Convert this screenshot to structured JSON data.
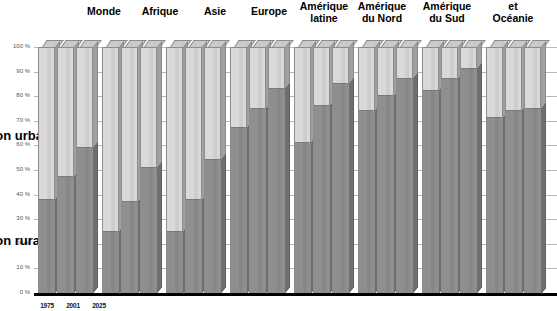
{
  "chart_data": {
    "type": "bar",
    "subtype": "stacked-100-percent-3d",
    "title": "",
    "xlabel": "",
    "ylabel": "",
    "ylim": [
      0,
      100
    ],
    "grid": true,
    "legend_position": "left-outside-clipped",
    "categories": [
      "1975",
      "2001",
      "2025"
    ],
    "groups": [
      "Monde",
      "Afrique",
      "Asie",
      "Europe",
      "Amérique latine",
      "Amérique du Nord",
      "Amérique du Sud",
      "et Océanie"
    ],
    "ytick_labels": [
      "100 %",
      "90 %",
      "80 %",
      "70 %",
      "60 %",
      "50 %",
      "40 %",
      "30 %",
      "20 %",
      "10 %",
      "0 %"
    ],
    "ytick_values": [
      100,
      90,
      80,
      70,
      60,
      50,
      40,
      30,
      20,
      10,
      0
    ],
    "series": [
      {
        "name": "Population urbaine",
        "color": "#8f8f8f",
        "values_by_group": {
          "Monde": [
            38,
            47,
            59
          ],
          "Afrique": [
            25,
            37,
            51
          ],
          "Asie": [
            25,
            38,
            54
          ],
          "Europe": [
            67,
            75,
            83
          ],
          "Amérique latine": [
            61,
            76,
            85
          ],
          "Amérique du Nord": [
            74,
            80,
            87
          ],
          "Amérique du Sud": [
            82,
            87,
            91
          ],
          "et Océanie": [
            71,
            74,
            75
          ]
        }
      },
      {
        "name": "Population rurale",
        "color": "#d9d9d9",
        "values_by_group": {
          "Monde": [
            62,
            53,
            41
          ],
          "Afrique": [
            75,
            63,
            49
          ],
          "Asie": [
            75,
            62,
            46
          ],
          "Europe": [
            33,
            25,
            17
          ],
          "Amérique latine": [
            39,
            24,
            15
          ],
          "Amérique du Nord": [
            26,
            20,
            13
          ],
          "Amérique du Sud": [
            18,
            13,
            9
          ],
          "et Océanie": [
            29,
            26,
            25
          ]
        }
      }
    ]
  },
  "legend_stubs": [
    {
      "text": "Population urbaine",
      "visible_fragment": "le",
      "top": 128
    },
    {
      "text": "Population rurale",
      "visible_fragment": "ine",
      "top": 233
    }
  ],
  "group_titles": [
    {
      "label": "Monde",
      "cx": 104,
      "top": 6
    },
    {
      "label": "Afrique",
      "cx": 160,
      "top": 6
    },
    {
      "label": "Asie",
      "cx": 215,
      "top": 6
    },
    {
      "label": "Europe",
      "cx": 269,
      "top": 6
    },
    {
      "label": "Amérique\nlatine",
      "cx": 324,
      "top": 1
    },
    {
      "label": "Amérique\ndu Nord",
      "cx": 382,
      "top": 1
    },
    {
      "label": "Amérique\ndu Sud",
      "cx": 447,
      "top": 1
    },
    {
      "label": "et\nOcéanie",
      "cx": 513,
      "top": 1
    }
  ],
  "axis_year_labels": [
    {
      "label": "1975",
      "cx": 47
    },
    {
      "label": "2001",
      "cx": 73
    },
    {
      "label": "2025",
      "cx": 99
    }
  ],
  "colors": {
    "urban": "#8f8f8f",
    "rural": "#d9d9d9",
    "bar_top": "#c9c9c9",
    "bar_side": "#a0a0a0",
    "gridline": "#b9b9b9",
    "axis": "#000000",
    "background": "#ffffff",
    "tick_text": "#555555"
  }
}
